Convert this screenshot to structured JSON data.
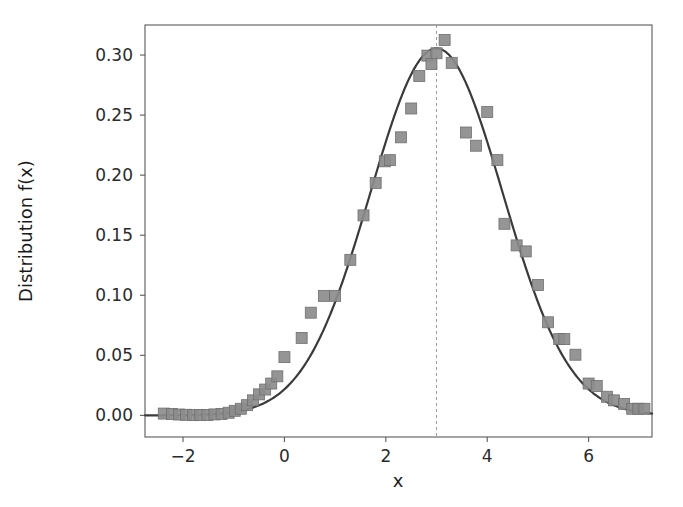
{
  "figure": {
    "background_color": "#ffffff",
    "frame_color": "#5a5a5a",
    "curve_color": "#3a3a3a",
    "marker_color": "#8c8c8c",
    "marker_edge_color": "#6f6f6f",
    "vline_color": "#9a9a9a"
  },
  "chart_data": {
    "type": "scatter",
    "title": "",
    "xlabel": "x",
    "ylabel": "Distribution f(x)",
    "xlim": [
      -2.75,
      7.25
    ],
    "ylim": [
      -0.018,
      0.325
    ],
    "xticks": [
      -2,
      0,
      2,
      4,
      6
    ],
    "xtick_labels": [
      "−2",
      "0",
      "2",
      "4",
      "6"
    ],
    "yticks": [
      0.0,
      0.05,
      0.1,
      0.15,
      0.2,
      0.25,
      0.3
    ],
    "ytick_labels": [
      "0.00",
      "0.05",
      "0.10",
      "0.15",
      "0.20",
      "0.25",
      "0.30"
    ],
    "grid": false,
    "legend": null,
    "annotations": [
      {
        "kind": "vertical-dashed-line",
        "x": 3.0,
        "label": "mean"
      }
    ],
    "series": [
      {
        "name": "fitted gaussian curve",
        "type": "line",
        "color": "#3a3a3a",
        "linewidth": 2.2,
        "model": "gaussian",
        "params": {
          "amplitude": 0.3055,
          "mean": 3.0,
          "sigma": 1.305
        },
        "x": [
          -2.75,
          -2.5,
          -2.25,
          -2.0,
          -1.75,
          -1.5,
          -1.25,
          -1.0,
          -0.75,
          -0.5,
          -0.25,
          0.0,
          0.25,
          0.5,
          0.75,
          1.0,
          1.25,
          1.5,
          1.75,
          2.0,
          2.25,
          2.5,
          2.75,
          3.0,
          3.25,
          3.5,
          3.75,
          4.0,
          4.25,
          4.5,
          4.75,
          5.0,
          5.25,
          5.5,
          5.75,
          6.0,
          6.25,
          6.5,
          6.75,
          7.0,
          7.25
        ],
        "y": [
          0.0004,
          0.0008,
          0.0014,
          0.0024,
          0.0039,
          0.0063,
          0.0098,
          0.0149,
          0.022,
          0.0316,
          0.0441,
          0.0598,
          0.0787,
          0.1007,
          0.1251,
          0.1511,
          0.1775,
          0.2027,
          0.2253,
          0.2439,
          0.2574,
          0.2652,
          0.2672,
          0.3055,
          0.2672,
          0.2652,
          0.2574,
          0.2439,
          0.2253,
          0.2027,
          0.1775,
          0.1511,
          0.1251,
          0.1007,
          0.0787,
          0.0598,
          0.0441,
          0.0316,
          0.022,
          0.0149,
          0.0098
        ]
      },
      {
        "name": "observed data",
        "type": "scatter",
        "marker": "square",
        "color": "#8c8c8c",
        "points": [
          [
            -2.38,
            0.0015
          ],
          [
            -2.22,
            0.0012
          ],
          [
            -2.08,
            0.0007
          ],
          [
            -1.94,
            0.0005
          ],
          [
            -1.8,
            0.0002
          ],
          [
            -1.66,
            0.0004
          ],
          [
            -1.52,
            0.0004
          ],
          [
            -1.38,
            0.0008
          ],
          [
            -1.24,
            0.0012
          ],
          [
            -1.1,
            0.0022
          ],
          [
            -0.98,
            0.0038
          ],
          [
            -0.86,
            0.0055
          ],
          [
            -0.74,
            0.0085
          ],
          [
            -0.62,
            0.0125
          ],
          [
            -0.5,
            0.0175
          ],
          [
            -0.38,
            0.0215
          ],
          [
            -0.26,
            0.0265
          ],
          [
            -0.14,
            0.0325
          ],
          [
            0.0,
            0.0485
          ],
          [
            0.34,
            0.0645
          ],
          [
            0.52,
            0.0855
          ],
          [
            0.78,
            0.0995
          ],
          [
            1.0,
            0.0995
          ],
          [
            1.3,
            0.1295
          ],
          [
            1.56,
            0.1665
          ],
          [
            1.8,
            0.1935
          ],
          [
            1.98,
            0.2115
          ],
          [
            2.08,
            0.2125
          ],
          [
            2.3,
            0.2315
          ],
          [
            2.5,
            0.2555
          ],
          [
            2.66,
            0.2825
          ],
          [
            2.82,
            0.2995
          ],
          [
            2.9,
            0.2925
          ],
          [
            3.0,
            0.3015
          ],
          [
            3.16,
            0.3125
          ],
          [
            3.3,
            0.2935
          ],
          [
            3.58,
            0.2355
          ],
          [
            3.78,
            0.2245
          ],
          [
            4.0,
            0.2525
          ],
          [
            4.2,
            0.2125
          ],
          [
            4.34,
            0.1595
          ],
          [
            4.58,
            0.1415
          ],
          [
            4.76,
            0.1365
          ],
          [
            5.0,
            0.1085
          ],
          [
            5.2,
            0.0775
          ],
          [
            5.42,
            0.0635
          ],
          [
            5.52,
            0.0635
          ],
          [
            5.74,
            0.0505
          ],
          [
            6.0,
            0.0265
          ],
          [
            6.16,
            0.0245
          ],
          [
            6.36,
            0.0155
          ],
          [
            6.5,
            0.0125
          ],
          [
            6.7,
            0.0095
          ],
          [
            6.86,
            0.0055
          ],
          [
            6.98,
            0.0055
          ],
          [
            7.1,
            0.0055
          ]
        ]
      }
    ]
  }
}
